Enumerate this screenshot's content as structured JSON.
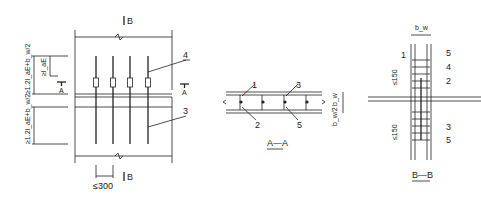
{
  "plan_view": {
    "section_marker_top": "B",
    "section_marker_bottom": "B",
    "section_a_left": "A",
    "section_a_right": "A",
    "dim_upper": "≥1.2l_aE+b_w/2",
    "dim_lae": "≥l_aE",
    "dim_lower": "≥1.2l_aE+b_w/2",
    "dim_spacing": "≤300",
    "callout_4": "4",
    "callout_3": "3"
  },
  "section_aa": {
    "title": "A—A",
    "callouts": [
      "1",
      "2",
      "3",
      "5"
    ],
    "dim_top": "b_w",
    "dim_bottom": "b_w/2"
  },
  "section_bb": {
    "title": "B—B",
    "dim_width": "b_w",
    "dim_top_spacing": "≤150",
    "dim_bottom_spacing": "≤150",
    "callouts": [
      "1",
      "5",
      "4",
      "2",
      "3",
      "5"
    ]
  }
}
